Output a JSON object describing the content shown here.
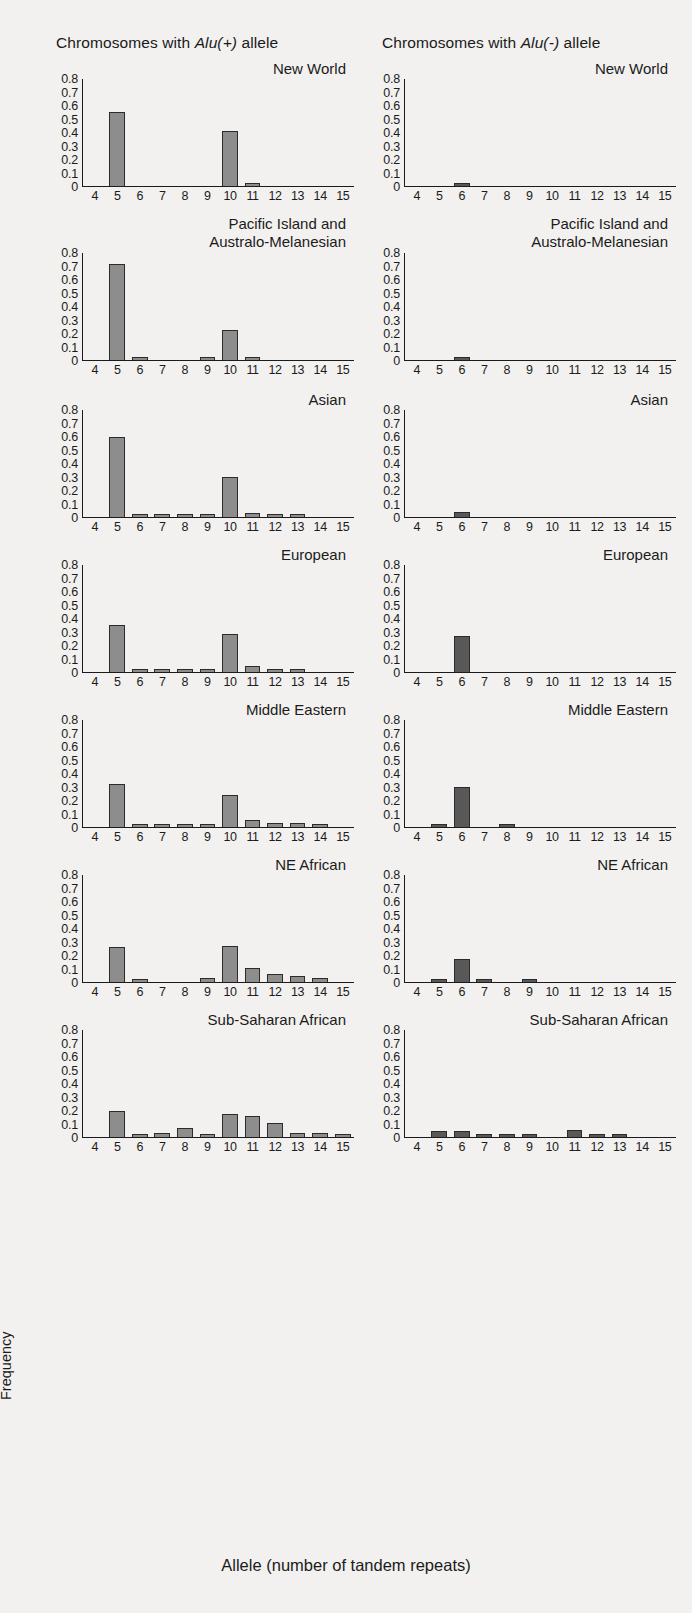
{
  "figure": {
    "x_caption": "Allele (number of tandem repeats)",
    "y_caption": "Frequency",
    "columns": [
      {
        "id": "alu-plus",
        "prefix": "Chromosomes with ",
        "italic": "Alu(+)",
        "suffix": " allele"
      },
      {
        "id": "alu-minus",
        "prefix": "Chromosomes with ",
        "italic": "Alu(-)",
        "suffix": " allele"
      }
    ],
    "y_ticks": [
      "0.8",
      "0.7",
      "0.6",
      "0.5",
      "0.4",
      "0.3",
      "0.2",
      "0.1",
      "0"
    ],
    "x_ticks": [
      "4",
      "5",
      "6",
      "7",
      "8",
      "9",
      "10",
      "11",
      "12",
      "13",
      "14",
      "15"
    ],
    "colors": {
      "alu_plus_bar": "#8d8d8d",
      "alu_minus_bar": "#585858",
      "axis": "#1b1b1b",
      "background": "#f2f1ef"
    }
  },
  "chart_data": {
    "type": "bar",
    "xlabel": "Allele (number of tandem repeats)",
    "ylabel": "Frequency",
    "ylim": [
      0,
      0.8
    ],
    "yticks": [
      0,
      0.1,
      0.2,
      0.3,
      0.4,
      0.5,
      0.6,
      0.7,
      0.8
    ],
    "grid": false,
    "legend": "none",
    "categories": [
      4,
      5,
      6,
      7,
      8,
      9,
      10,
      11,
      12,
      13,
      14,
      15
    ],
    "panels": [
      {
        "population": "New World",
        "column": "Chromosomes with Alu(+) allele",
        "series_name": "Alu(+)",
        "values": [
          0,
          0.55,
          0,
          0,
          0,
          0,
          0.41,
          0.01,
          0,
          0,
          0,
          0
        ]
      },
      {
        "population": "New World",
        "column": "Chromosomes with Alu(-) allele",
        "series_name": "Alu(-)",
        "values": [
          0,
          0,
          0.015,
          0,
          0,
          0,
          0,
          0,
          0,
          0,
          0,
          0
        ]
      },
      {
        "population": "Pacific Island and Australo-Melanesian",
        "column": "Chromosomes with Alu(+) allele",
        "series_name": "Alu(+)",
        "values": [
          0,
          0.72,
          0.015,
          0,
          0,
          0.01,
          0.22,
          0.015,
          0,
          0,
          0,
          0
        ]
      },
      {
        "population": "Pacific Island and Australo-Melanesian",
        "column": "Chromosomes with Alu(-) allele",
        "series_name": "Alu(-)",
        "values": [
          0,
          0,
          0.012,
          0,
          0,
          0,
          0,
          0,
          0,
          0,
          0,
          0
        ]
      },
      {
        "population": "Asian",
        "column": "Chromosomes with Alu(+) allele",
        "series_name": "Alu(+)",
        "values": [
          0,
          0.6,
          0.015,
          0.008,
          0.005,
          0.005,
          0.3,
          0.025,
          0.008,
          0.005,
          0,
          0
        ]
      },
      {
        "population": "Asian",
        "column": "Chromosomes with Alu(-) allele",
        "series_name": "Alu(-)",
        "values": [
          0,
          0,
          0.035,
          0,
          0,
          0,
          0,
          0,
          0,
          0,
          0,
          0
        ]
      },
      {
        "population": "European",
        "column": "Chromosomes with Alu(+) allele",
        "series_name": "Alu(+)",
        "values": [
          0,
          0.35,
          0.015,
          0.01,
          0.005,
          0.015,
          0.28,
          0.045,
          0.02,
          0.005,
          0,
          0
        ]
      },
      {
        "population": "European",
        "column": "Chromosomes with Alu(-) allele",
        "series_name": "Alu(-)",
        "values": [
          0,
          0,
          0.27,
          0,
          0,
          0,
          0,
          0,
          0,
          0,
          0,
          0
        ]
      },
      {
        "population": "Middle Eastern",
        "column": "Chromosomes with Alu(+) allele",
        "series_name": "Alu(+)",
        "values": [
          0,
          0.32,
          0.02,
          0.01,
          0.005,
          0.015,
          0.24,
          0.05,
          0.03,
          0.03,
          0.005,
          0
        ]
      },
      {
        "population": "Middle Eastern",
        "column": "Chromosomes with Alu(-) allele",
        "series_name": "Alu(-)",
        "values": [
          0,
          0.015,
          0.3,
          0,
          0.012,
          0,
          0,
          0,
          0,
          0,
          0,
          0
        ]
      },
      {
        "population": "NE African",
        "column": "Chromosomes with Alu(+) allele",
        "series_name": "Alu(+)",
        "values": [
          0,
          0.26,
          0.02,
          0,
          0,
          0.025,
          0.27,
          0.1,
          0.055,
          0.04,
          0.03,
          0
        ]
      },
      {
        "population": "NE African",
        "column": "Chromosomes with Alu(-) allele",
        "series_name": "Alu(-)",
        "values": [
          0,
          0.02,
          0.17,
          0.008,
          0,
          0.02,
          0,
          0,
          0,
          0,
          0,
          0
        ]
      },
      {
        "population": "Sub-Saharan African",
        "column": "Chromosomes with Alu(+) allele",
        "series_name": "Alu(+)",
        "values": [
          0,
          0.19,
          0.02,
          0.025,
          0.065,
          0.02,
          0.17,
          0.155,
          0.1,
          0.03,
          0.03,
          0.012
        ]
      },
      {
        "population": "Sub-Saharan African",
        "column": "Chromosomes with Alu(-) allele",
        "series_name": "Alu(-)",
        "values": [
          0,
          0.045,
          0.045,
          0.015,
          0.008,
          0.005,
          0,
          0.05,
          0.01,
          0.005,
          0,
          0
        ]
      }
    ]
  },
  "rows": [
    {
      "title": "New World",
      "two_line": false
    },
    {
      "title": "Pacific Island and\nAustralo-Melanesian",
      "two_line": true
    },
    {
      "title": "Asian",
      "two_line": false
    },
    {
      "title": "European",
      "two_line": false
    },
    {
      "title": "Middle Eastern",
      "two_line": false
    },
    {
      "title": "NE African",
      "two_line": false
    },
    {
      "title": "Sub-Saharan African",
      "two_line": false
    }
  ]
}
